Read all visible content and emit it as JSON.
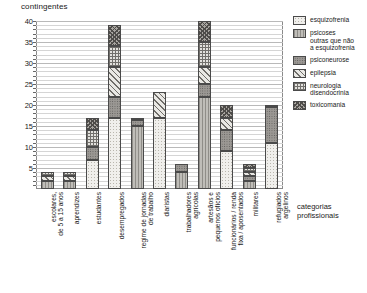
{
  "chart_data": {
    "type": "bar",
    "stacked": true,
    "title": "",
    "ylabel": "contingentes",
    "xlabel": "categorias profissionais",
    "ylim": [
      0,
      40
    ],
    "yticks": [
      5,
      10,
      15,
      20,
      25,
      30,
      35,
      40
    ],
    "grid": true,
    "legend_position": "right",
    "categories": [
      "escolares,\nde 5 a 15 anos",
      "aprendizes",
      "estudantes",
      "desempregados",
      "regime de jornadas\nde trabalho",
      "diaristas",
      "trabalhadores\nagrícolas",
      "artesãos e\npequenos ofícios",
      "funcionários / renda\nfixa / aposentados",
      "militares",
      "refugiados\nargelinos"
    ],
    "series": [
      {
        "name": "esquizofrenia",
        "values": [
          0,
          0,
          7,
          17,
          0,
          17,
          0,
          0,
          9,
          0,
          11
        ]
      },
      {
        "name": "psicoses\noutras que não\na esquizofrenia",
        "values": [
          2,
          2,
          0,
          0,
          15,
          0,
          4,
          22,
          0,
          2,
          0
        ]
      },
      {
        "name": "psiconeurose",
        "values": [
          0,
          0,
          3,
          5,
          1.5,
          0,
          2,
          3,
          5,
          1,
          8.5
        ]
      },
      {
        "name": "epilepsia",
        "values": [
          1,
          1,
          0,
          7,
          0,
          6,
          0,
          4,
          3,
          1,
          0
        ]
      },
      {
        "name": "neurologia\ndisendocrinia",
        "values": [
          1,
          1,
          4,
          5,
          0.5,
          0,
          0,
          6,
          0,
          1,
          0.5
        ]
      },
      {
        "name": "toxicomania",
        "values": [
          0,
          0,
          3,
          5,
          0,
          0,
          0,
          5,
          3,
          1,
          0
        ]
      }
    ],
    "totals": [
      4,
      4,
      17,
      39,
      17,
      23,
      6,
      40,
      20,
      6,
      20
    ]
  },
  "legend": {
    "items": [
      {
        "label": "esquizofrenia",
        "pattern": "p-esquizofrenia"
      },
      {
        "label": "psicoses\nSoutras que não\na esquizofrenia",
        "pattern": "p-psicoses"
      },
      {
        "label": "psiconeurose",
        "pattern": "p-psiconeurose"
      },
      {
        "label": "epilepsia",
        "pattern": "p-epilepsia"
      },
      {
        "label": "neurologia\ndisendocrinia",
        "pattern": "p-neurologia"
      },
      {
        "label": "toxicomania",
        "pattern": "p-toxicomania"
      }
    ]
  },
  "colors": {
    "axis": "#8a8a8a",
    "grid": "#b9b9b9",
    "text": "#1a1a1a",
    "segment_border": "#4a4a4a"
  }
}
